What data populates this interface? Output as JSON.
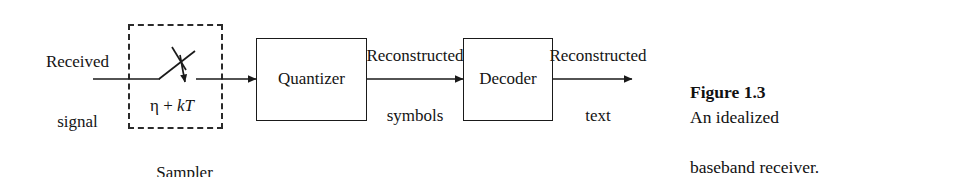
{
  "figure": {
    "caption_bold": "Figure 1.3",
    "caption_rest": "An idealized",
    "caption_line2": "baseband receiver."
  },
  "diagram": {
    "type": "block-diagram",
    "title": "An idealized baseband receiver",
    "input_label_line1": "Received",
    "input_label_line2": "signal",
    "sampler": {
      "box_label": "Sampler",
      "formula_eta": "η",
      "formula_plus": " + ",
      "formula_k": "k",
      "formula_T": "T",
      "formula_full": "η + kT",
      "style": "dashed"
    },
    "blocks": [
      {
        "id": "quantizer",
        "label": "Quantizer"
      },
      {
        "id": "decoder",
        "label": "Decoder"
      }
    ],
    "signal_labels": [
      {
        "id": "reconstructed-symbols",
        "line1": "Reconstructed",
        "line2": "symbols"
      },
      {
        "id": "reconstructed-text",
        "line1": "Reconstructed",
        "line2": "text"
      }
    ],
    "colors": {
      "ink": "#1a1a1a",
      "background": "#ffffff"
    }
  }
}
